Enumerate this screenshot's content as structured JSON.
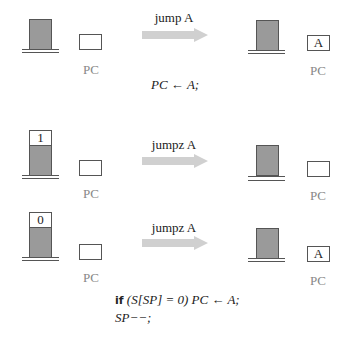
{
  "colors": {
    "stack_fill": "#9a9a9a",
    "arrow_fill": "#d0d0d0",
    "outline": "#555555",
    "pc_label": "#888888"
  },
  "rows": [
    {
      "operation": "jump A",
      "before": {
        "stack_top_value": null,
        "pc_value": "",
        "pc_label": "PC"
      },
      "after": {
        "stack_top_value": null,
        "pc_value": "A",
        "pc_label": "PC"
      },
      "semantics": [
        "PC ← A;"
      ]
    },
    {
      "operation": "jumpz A",
      "before": {
        "stack_top_value": "1",
        "pc_value": "",
        "pc_label": "PC"
      },
      "after": {
        "stack_top_value": null,
        "pc_value": "",
        "pc_label": "PC"
      },
      "semantics": []
    },
    {
      "operation": "jumpz A",
      "before": {
        "stack_top_value": "0",
        "pc_value": "",
        "pc_label": "PC"
      },
      "after": {
        "stack_top_value": null,
        "pc_value": "A",
        "pc_label": "PC"
      },
      "semantics": {
        "keyword": "if",
        "line1_rest": " (S[SP] = 0) PC ← A;",
        "line2": "SP−−;"
      }
    }
  ]
}
